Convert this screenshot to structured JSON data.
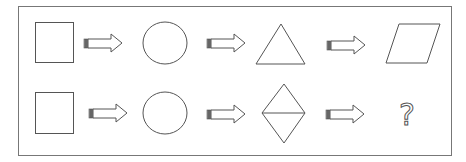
{
  "puzzle": {
    "rows": [
      {
        "shapes": [
          "square",
          "circle",
          "triangle",
          "parallelogram"
        ]
      },
      {
        "shapes": [
          "square",
          "circle",
          "diamond-split",
          "unknown"
        ]
      }
    ],
    "connector": "right-arrow-icon",
    "unknown_symbol": "?",
    "stroke_color": "#555555",
    "frame_color": "#777777"
  }
}
